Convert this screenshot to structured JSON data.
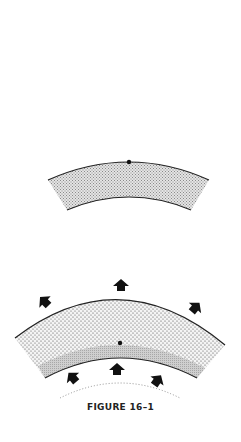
{
  "figure": {
    "caption": "FIGURE 16–1",
    "colors": {
      "background": "#ffffff",
      "stroke": "#222222",
      "fine_stipple": "#9a9a9a",
      "coarse_stipple": "#444444",
      "gray_layer": "#c8c8c8"
    },
    "panels": [
      {
        "id": "upper",
        "description": "Curved band with fine stipple; dot on upper edge",
        "has_dot": true,
        "arrows": 0
      },
      {
        "id": "lower",
        "description": "Thicker curved band with coarse stipple and gray basal layer; dot in interior; outward arrows above, inward-pushing arrows below, dotted arc beneath",
        "has_dot": true,
        "arrows_above": 3,
        "arrows_below": 3
      }
    ]
  }
}
